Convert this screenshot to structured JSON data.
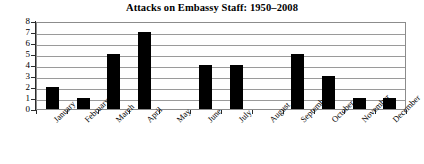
{
  "chart_data": {
    "type": "bar",
    "title": "Attacks on Embassy Staff: 1950–2008",
    "xlabel": "",
    "ylabel": "",
    "categories": [
      "January",
      "February",
      "March",
      "April",
      "May",
      "June",
      "July",
      "August",
      "September",
      "October",
      "November",
      "December"
    ],
    "values": [
      2,
      1,
      5,
      7,
      0,
      4,
      4,
      0,
      5,
      3,
      1,
      1
    ],
    "ylim": [
      0,
      8
    ],
    "ytick_labels": [
      "8",
      "7",
      "6",
      "5",
      "4",
      "3",
      "2",
      "1",
      "0"
    ],
    "ytick_values": [
      8,
      7,
      6,
      5,
      4,
      3,
      2,
      1,
      0
    ],
    "grid": true,
    "legend": false,
    "bar_color": "#000000",
    "grid_color": "#9a9a9a",
    "background_color": "#ffffff"
  }
}
